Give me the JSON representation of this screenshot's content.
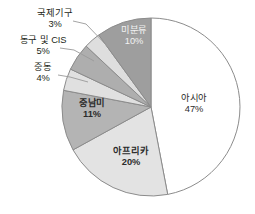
{
  "chart_data": {
    "type": "pie",
    "title": "",
    "subtitle": "",
    "xlabel": "",
    "ylabel": "",
    "legend_position": "none",
    "grid": false,
    "start_angle_deg": 0,
    "direction": "clockwise",
    "categories": [
      "아시아",
      "아프리카",
      "중남미",
      "중동",
      "동구 및 CIS",
      "국제기구",
      "미분류"
    ],
    "values": [
      47,
      20,
      11,
      4,
      5,
      3,
      10
    ],
    "value_suffix": "%",
    "colors": [
      "#ffffff",
      "#e3e3e3",
      "#b4b4b4",
      "#e0e0e0",
      "#aeaeae",
      "#dedede",
      "#9e9e9e"
    ],
    "slices": [
      {
        "name": "아시아",
        "value": 47,
        "value_label": "47%",
        "color": "#ffffff",
        "label_placement": "inside",
        "label_color": "#2b2b2b",
        "bold": false
      },
      {
        "name": "아프리카",
        "value": 20,
        "value_label": "20%",
        "color": "#e3e3e3",
        "label_placement": "inside",
        "label_color": "#2b2b2b",
        "bold": true
      },
      {
        "name": "중남미",
        "value": 11,
        "value_label": "11%",
        "color": "#b4b4b4",
        "label_placement": "inside",
        "label_color": "#2b2b2b",
        "bold": true
      },
      {
        "name": "중동",
        "value": 4,
        "value_label": "4%",
        "color": "#e0e0e0",
        "label_placement": "outside-left",
        "label_color": "#231f20",
        "bold": false
      },
      {
        "name": "동구 및 CIS",
        "value": 5,
        "value_label": "5%",
        "color": "#aeaeae",
        "label_placement": "outside-left",
        "label_color": "#231f20",
        "bold": false
      },
      {
        "name": "국제기구",
        "value": 3,
        "value_label": "3%",
        "color": "#dedede",
        "label_placement": "outside-left",
        "label_color": "#231f20",
        "bold": false
      },
      {
        "name": "미분류",
        "value": 10,
        "value_label": "10%",
        "color": "#9e9e9e",
        "label_placement": "inside",
        "label_color": "#f2f2f2",
        "bold": false
      }
    ]
  },
  "labels": {
    "asia": {
      "name": "아시아",
      "pct": "47%"
    },
    "africa": {
      "name": "아프리카",
      "pct": "20%"
    },
    "latam": {
      "name": "중남미",
      "pct": "11%"
    },
    "mideast": {
      "name": "중동",
      "pct": "4%"
    },
    "cis": {
      "name": "동구 및 CIS",
      "pct": "5%"
    },
    "intorg": {
      "name": "국제기구",
      "pct": "3%"
    },
    "unclass": {
      "name": "미분류",
      "pct": "10%"
    }
  },
  "style": {
    "slice_border": "#8c8c8c",
    "leader_line": "#9a9a9a",
    "text_color": "#231f20",
    "inside_dark_text": "#f2f2f2",
    "background": "#ffffff"
  }
}
